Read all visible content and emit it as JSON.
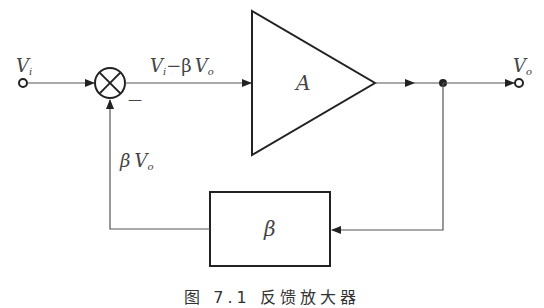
{
  "diagram": {
    "type": "feedback-amplifier-block-diagram",
    "input_label": "V",
    "input_sub": "i",
    "output_label": "V",
    "output_sub": "o",
    "error_label_a": "V",
    "error_label_a_sub": "i",
    "error_label_op": "−β",
    "error_label_b": "V",
    "error_label_b_sub": "o",
    "summer_minus_sign": "—",
    "amplifier_label": "A",
    "feedback_block_label": "β",
    "feedback_signal_label": "β",
    "feedback_signal_v": "V",
    "feedback_signal_sub": "o",
    "caption": "图 7.1 反馈放大器"
  },
  "colors": {
    "stroke": "#222222",
    "thin_stroke": "#555555",
    "label": "#444444"
  }
}
